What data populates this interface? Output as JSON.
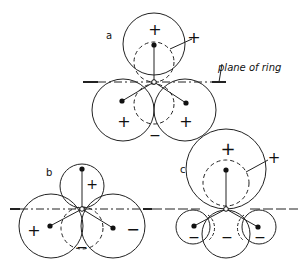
{
  "figure": {
    "panels": [
      {
        "id": "a",
        "label": "a",
        "signs": [
          "+",
          "+",
          "+",
          "+",
          "−"
        ]
      },
      {
        "id": "b",
        "label": "b",
        "signs": [
          "+",
          "+",
          "−",
          "−"
        ]
      },
      {
        "id": "c",
        "label": "c",
        "signs": [
          "+",
          "+",
          "−",
          "−",
          "−"
        ]
      }
    ],
    "annotation": "plane of ring"
  }
}
